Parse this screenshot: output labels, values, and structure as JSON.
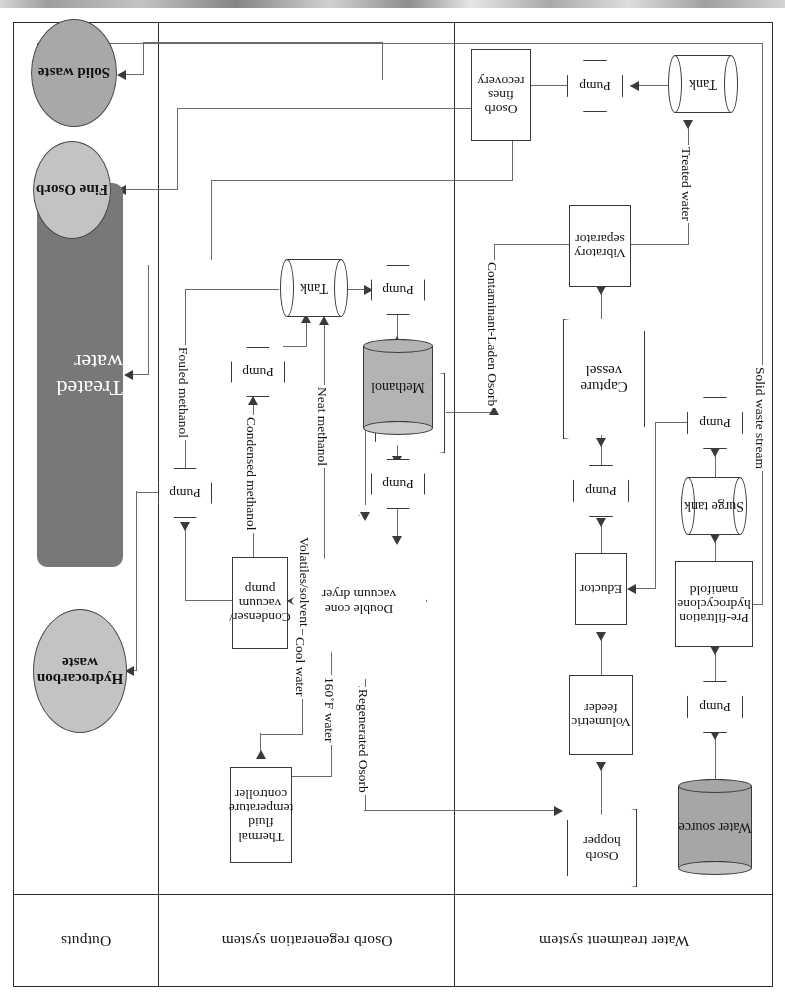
{
  "diagram": {
    "orientation_note": "rotated-180",
    "colors": {
      "treated_water_fill": "#787878",
      "solid_waste_fill": "#a8a8a8",
      "fine_osorb_fill": "#c3c3c3",
      "hydrocarbon_waste_fill": "#c3c3c3",
      "water_source_fill": "#a6a6a6",
      "methanol_fill": "#b3b3b3",
      "line": "#6a6a6a",
      "border": "#3a3a3a"
    }
  },
  "lanes": [
    {
      "id": "water-treatment",
      "label": "Water treatment system"
    },
    {
      "id": "osorb-regeneration",
      "label": "Osorb regeneration system"
    },
    {
      "id": "outputs",
      "label": "Outputs"
    }
  ],
  "nodes": {
    "water_source": "Water source",
    "pump_1": "Pump",
    "prefiltration": "Pre-filtration hydrocyclone manifold",
    "surge_tank": "Surge tank",
    "pump_2": "Pump",
    "osorb_hopper_feed": "Osorb hopper",
    "volumetric_feeder": "Volumetric feeder",
    "eductor": "Eductor",
    "pump_3": "Pump",
    "capture_vessel": "Capture vessel",
    "vibratory_separator": "Vibratory separator",
    "tank_water": "Tank",
    "pump_4": "Pump",
    "osorb_fines_recovery": "Osorb fines recovery",
    "osorb_hopper_regen": "Osorb hopper",
    "double_cone_dryer": "Double cone vacuum dryer",
    "pump_5": "Pump",
    "methanol": "Methanol",
    "pump_6": "Pump",
    "tank_methanol": "Tank",
    "pump_7": "Pump",
    "condenser": "Condenser/ vacuum pump",
    "pump_8": "Pump",
    "thermal_controller": "Thermal fluid temperature controller"
  },
  "outputs": {
    "solid_waste": "Solid waste",
    "fine_osorb": "Fine Osorb",
    "treated_water": "Treated water",
    "hydrocarbon_waste": "Hydrocarbon waste"
  },
  "edge_labels": {
    "solid_waste_stream": "Solid waste stream",
    "treated_water": "Treated water",
    "contaminant_laden_osorb": "Contaminant-Laden Osorb",
    "regenerated_osorb": "Regenerated Osorb",
    "neat_methanol": "Neat methanol",
    "volatiles_solvent": "Volatiles/solvent",
    "condensed_methanol": "Condensed methanol",
    "fouled_methanol": "Fouled methanol",
    "water_160f": "160˚F water",
    "cool_water": "Cool water"
  }
}
